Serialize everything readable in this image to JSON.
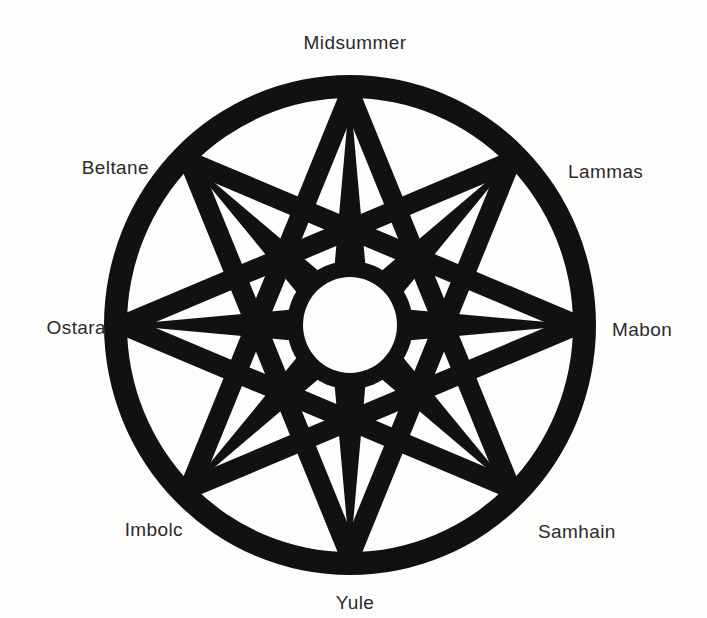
{
  "figure": {
    "background_color": "#fdfdfc",
    "ink_color": "#111111",
    "label_color": "#2b2b2b"
  },
  "wheel": {
    "center_x": 350,
    "center_y": 325,
    "outer_radius_x": 246,
    "outer_radius_y": 250,
    "ring_thickness": 23,
    "hub_radius_x": 47,
    "hub_radius_y": 48,
    "point_count": 8,
    "star_skip": 3,
    "spoke_count": 8
  },
  "labels": [
    {
      "id": "midsummer",
      "text": "Midsummer",
      "x": 355,
      "y": 33,
      "align": "center",
      "compass": "north"
    },
    {
      "id": "lammas",
      "text": "Lammas",
      "x": 568,
      "y": 162,
      "align": "left",
      "compass": "northeast"
    },
    {
      "id": "mabon",
      "text": "Mabon",
      "x": 612,
      "y": 320,
      "align": "left",
      "compass": "east"
    },
    {
      "id": "samhain",
      "text": "Samhain",
      "x": 538,
      "y": 522,
      "align": "left",
      "compass": "southeast"
    },
    {
      "id": "yule",
      "text": "Yule",
      "x": 355,
      "y": 593,
      "align": "center",
      "compass": "south"
    },
    {
      "id": "imbolc",
      "text": "Imbolc",
      "x": 183,
      "y": 520,
      "align": "right",
      "compass": "southwest"
    },
    {
      "id": "ostara",
      "text": "Ostara",
      "x": 106,
      "y": 318,
      "align": "right",
      "compass": "west"
    },
    {
      "id": "beltane",
      "text": "Beltane",
      "x": 149,
      "y": 158,
      "align": "right",
      "compass": "northwest"
    }
  ]
}
